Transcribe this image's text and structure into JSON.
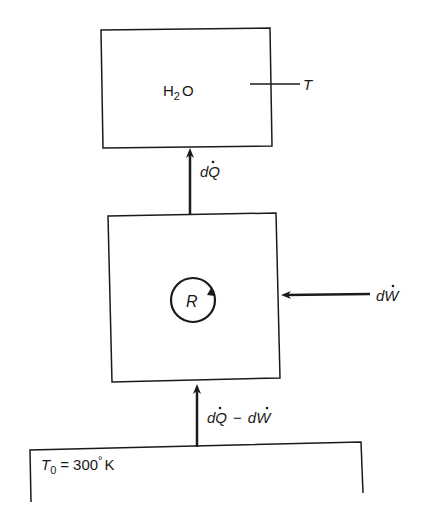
{
  "diagram": {
    "reservoir_top": {
      "substance": "H",
      "subscript": "2",
      "substance_suffix": "O",
      "temperature_label": "T"
    },
    "heat_flow_top": {
      "label_d": "d",
      "label_var": "Q"
    },
    "engine": {
      "label": "R"
    },
    "work_input": {
      "label_d": "d",
      "label_var": "W"
    },
    "heat_flow_bottom": {
      "label": "dQ − dW",
      "part1_d": "d",
      "part1_var": "Q",
      "minus": "−",
      "part2_d": "d",
      "part2_var": "W"
    },
    "reservoir_bottom": {
      "temp_symbol": "T",
      "temp_subscript": "0",
      "equals": "=",
      "value": "300",
      "degree": "°",
      "unit": "K"
    },
    "colors": {
      "stroke": "#1a1a1a",
      "background": "#ffffff"
    }
  }
}
